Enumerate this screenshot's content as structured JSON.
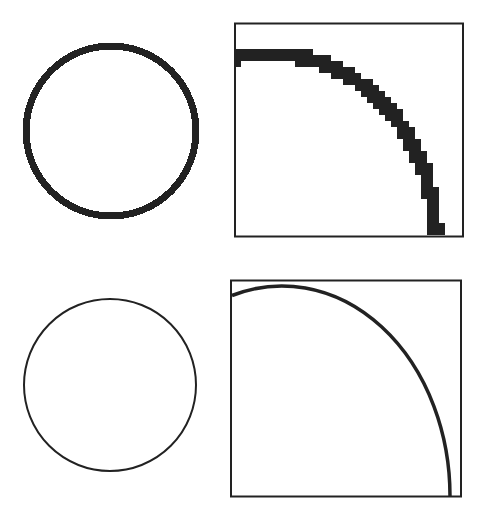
{
  "figure": {
    "stroke_color": "#222222",
    "background": "#ffffff",
    "panels": [
      {
        "id": "aliased-circle",
        "type": "circle",
        "cx": 111,
        "cy": 131,
        "r": 85,
        "stroke_width": 7,
        "aliased": true
      },
      {
        "id": "aliased-arc-zoom",
        "type": "framed-arc",
        "frame": {
          "x": 235,
          "y": 23,
          "w": 228,
          "h": 213
        },
        "arc": {
          "cx": 270,
          "cy": 236,
          "rx": 165,
          "ry": 183
        },
        "stroke_width": 15,
        "aliased": true
      },
      {
        "id": "smooth-circle",
        "type": "circle",
        "cx": 110,
        "cy": 385,
        "r": 85,
        "stroke_width": 2,
        "aliased": false
      },
      {
        "id": "smooth-arc-zoom",
        "type": "framed-arc",
        "frame": {
          "x": 231,
          "y": 280,
          "w": 230,
          "h": 216
        },
        "arc": {
          "cx": 282,
          "cy": 496,
          "rx": 168,
          "ry": 210
        },
        "stroke_width": 3.5,
        "aliased": false
      }
    ]
  }
}
